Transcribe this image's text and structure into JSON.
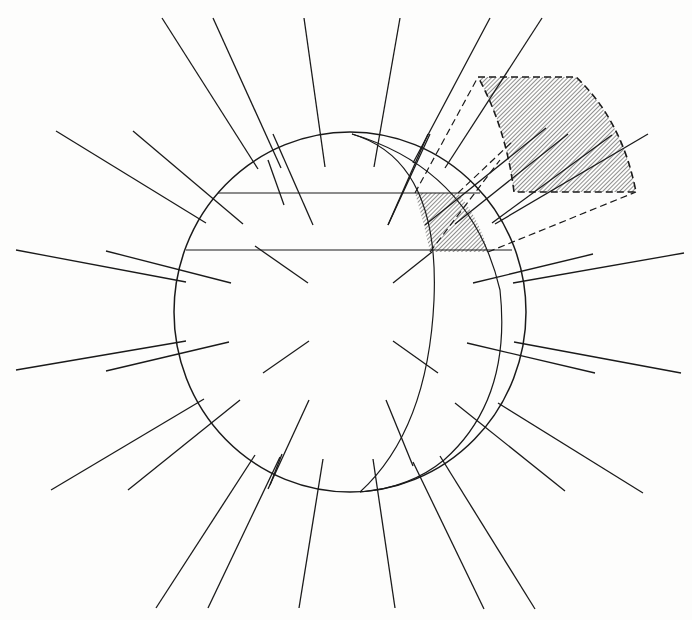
{
  "figure": {
    "width": 692,
    "height": 620,
    "background": "#fdfdfc",
    "stroke_color": "#1a1a1a",
    "hatch_color": "#333333",
    "sphere": {
      "cx": 350,
      "cy": 312,
      "rx": 176,
      "ry": 180
    },
    "inner_arc": "M 352 134 Q 440 160 434 300 Q 428 430 360 492",
    "middle_arc": "M 352 134 Q 472 170 500 290 Q 512 400 444 460 Q 410 488 360 492",
    "horizontal_lines": [
      {
        "x1": 218,
        "y1": 193,
        "x2": 480,
        "y2": 193
      },
      {
        "x1": 186,
        "y1": 250,
        "x2": 512,
        "y2": 250
      }
    ],
    "small_wedge": "M 415 193 L 458 193 Q 480 220 488 252 L 430 252 Q 424 222 415 193 Z",
    "large_wedge": "M 478 77 L 576 77 Q 622 120 636 192 L 514 192 Q 506 128 478 77 Z",
    "dashed_lines": [
      {
        "x1": 415,
        "y1": 193,
        "x2": 478,
        "y2": 77
      },
      {
        "x1": 458,
        "y1": 193,
        "x2": 514,
        "y2": 140
      },
      {
        "x1": 488,
        "y1": 252,
        "x2": 636,
        "y2": 192
      },
      {
        "x1": 430,
        "y1": 252,
        "x2": 500,
        "y2": 160
      }
    ],
    "radial_lines": [
      {
        "x1": 162,
        "y1": 18,
        "x2": 258,
        "y2": 169
      },
      {
        "x1": 213,
        "y1": 18,
        "x2": 281,
        "y2": 168
      },
      {
        "x1": 304,
        "y1": 18,
        "x2": 325,
        "y2": 167
      },
      {
        "x1": 400,
        "y1": 18,
        "x2": 374,
        "y2": 167
      },
      {
        "x1": 490,
        "y1": 18,
        "x2": 413,
        "y2": 163
      },
      {
        "x1": 542,
        "y1": 18,
        "x2": 445,
        "y2": 168
      },
      {
        "x1": 56,
        "y1": 131,
        "x2": 206,
        "y2": 223
      },
      {
        "x1": 133,
        "y1": 131,
        "x2": 243,
        "y2": 224
      },
      {
        "x1": 273,
        "y1": 134,
        "x2": 313,
        "y2": 225
      },
      {
        "x1": 430,
        "y1": 134,
        "x2": 388,
        "y2": 225
      },
      {
        "x1": 568,
        "y1": 134,
        "x2": 455,
        "y2": 224
      },
      {
        "x1": 648,
        "y1": 134,
        "x2": 495,
        "y2": 224
      },
      {
        "x1": 16,
        "y1": 250,
        "x2": 186,
        "y2": 282
      },
      {
        "x1": 106,
        "y1": 251,
        "x2": 231,
        "y2": 283
      },
      {
        "x1": 255,
        "y1": 246,
        "x2": 308,
        "y2": 283
      },
      {
        "x1": 432,
        "y1": 252,
        "x2": 393,
        "y2": 283
      },
      {
        "x1": 593,
        "y1": 254,
        "x2": 473,
        "y2": 283
      },
      {
        "x1": 684,
        "y1": 253,
        "x2": 513,
        "y2": 283
      },
      {
        "x1": 16,
        "y1": 370,
        "x2": 186,
        "y2": 341
      },
      {
        "x1": 106,
        "y1": 371,
        "x2": 229,
        "y2": 342
      },
      {
        "x1": 263,
        "y1": 373,
        "x2": 309,
        "y2": 341
      },
      {
        "x1": 438,
        "y1": 373,
        "x2": 393,
        "y2": 341
      },
      {
        "x1": 595,
        "y1": 373,
        "x2": 467,
        "y2": 343
      },
      {
        "x1": 681,
        "y1": 373,
        "x2": 514,
        "y2": 342
      },
      {
        "x1": 51,
        "y1": 490,
        "x2": 204,
        "y2": 399
      },
      {
        "x1": 128,
        "y1": 490,
        "x2": 240,
        "y2": 400
      },
      {
        "x1": 268,
        "y1": 489,
        "x2": 309,
        "y2": 400
      },
      {
        "x1": 413,
        "y1": 466,
        "x2": 386,
        "y2": 400
      },
      {
        "x1": 565,
        "y1": 491,
        "x2": 455,
        "y2": 403
      },
      {
        "x1": 643,
        "y1": 493,
        "x2": 498,
        "y2": 403
      },
      {
        "x1": 156,
        "y1": 608,
        "x2": 255,
        "y2": 455
      },
      {
        "x1": 208,
        "y1": 608,
        "x2": 280,
        "y2": 457
      },
      {
        "x1": 299,
        "y1": 608,
        "x2": 323,
        "y2": 459
      },
      {
        "x1": 395,
        "y1": 608,
        "x2": 373,
        "y2": 459
      },
      {
        "x1": 484,
        "y1": 609,
        "x2": 413,
        "y2": 462
      },
      {
        "x1": 535,
        "y1": 609,
        "x2": 440,
        "y2": 456
      },
      {
        "x1": 270,
        "y1": 485,
        "x2": 282,
        "y2": 454
      },
      {
        "x1": 268,
        "y1": 160,
        "x2": 284,
        "y2": 205
      }
    ],
    "extra_lines": [
      {
        "x1": 546,
        "y1": 128,
        "x2": 425,
        "y2": 225
      },
      {
        "x1": 612,
        "y1": 135,
        "x2": 492,
        "y2": 223
      },
      {
        "x1": 428,
        "y1": 134,
        "x2": 388,
        "y2": 225
      }
    ]
  }
}
